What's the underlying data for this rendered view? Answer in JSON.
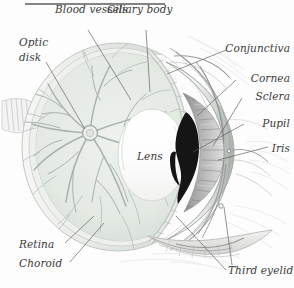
{
  "figure": {
    "background_color": "#fdfdfd",
    "ink_color": "#3b3b3b",
    "width": 294,
    "height": 288,
    "top_rule_color": "#6e6e6e"
  },
  "labels": {
    "blood_vessels": "Blood vessels",
    "ciliary_body": "Ciliary body",
    "optic_disk_line1": "Optic",
    "optic_disk_line2": "disk",
    "conjunctiva": "Conjunctiva",
    "cornea": "Cornea",
    "sclera": "Sclera",
    "pupil": "Pupil",
    "iris": "Iris",
    "lens": "Lens",
    "retina": "Retina",
    "choroid": "Choroid",
    "third_eyelid": "Third eyelid"
  },
  "structures": {
    "retina_fill": "#e7ebe6",
    "choroid_fill": "#cfd6cf",
    "sclera_fill": "#f4f4f2",
    "vessel_color": "#a9b3ad",
    "pupil_fill": "#151515",
    "iris_fill": "#9a9a9a",
    "lens_fill": "#fdfdfd",
    "tissue_color": "#b9b9b9"
  }
}
